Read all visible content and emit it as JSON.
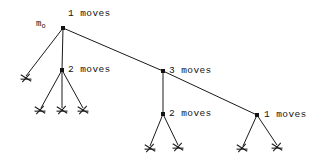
{
  "figure": {
    "background_color": "#ffffff",
    "line_color": "#1a1a1a",
    "text_color": "#111111"
  },
  "root": {
    "symbol_base": "m",
    "symbol_sub": "o",
    "label": "1 moves",
    "x": 63,
    "y": 28,
    "label_x": 68,
    "label_y": 8,
    "symbol_x": 36,
    "symbol_y": 19
  },
  "nodes": [
    {
      "id": "node-2-moves-left",
      "label": "2 moves",
      "x": 62,
      "y": 70,
      "label_x": 68,
      "label_y": 64,
      "children_count": 3
    },
    {
      "id": "node-3-moves",
      "label": "3 moves",
      "x": 163,
      "y": 71,
      "label_x": 169,
      "label_y": 65,
      "children_count": 1
    },
    {
      "id": "node-2-moves-lower",
      "label": "2 moves",
      "x": 163,
      "y": 114,
      "label_x": 169,
      "label_y": 108,
      "children_count": 2
    },
    {
      "id": "node-1-moves-right",
      "label": "1 moves",
      "x": 257,
      "y": 115,
      "label_x": 264,
      "label_y": 109,
      "children_count": 2
    }
  ],
  "leaves": [
    {
      "id": "leaf-root-1",
      "x": 26,
      "y": 78
    },
    {
      "id": "leaf-a-1",
      "x": 40,
      "y": 110
    },
    {
      "id": "leaf-a-2",
      "x": 62,
      "y": 110
    },
    {
      "id": "leaf-a-3",
      "x": 83,
      "y": 110
    },
    {
      "id": "leaf-b-1",
      "x": 150,
      "y": 148
    },
    {
      "id": "leaf-b-2",
      "x": 178,
      "y": 147
    },
    {
      "id": "leaf-c-1",
      "x": 242,
      "y": 148
    },
    {
      "id": "leaf-c-2",
      "x": 277,
      "y": 147
    }
  ],
  "edges": [
    {
      "id": "edge-root-to-leaf",
      "x1": 63,
      "y1": 28,
      "x2": 26,
      "y2": 76
    },
    {
      "id": "edge-root-to-node-2-left",
      "x1": 63,
      "y1": 28,
      "x2": 62,
      "y2": 70
    },
    {
      "id": "edge-root-to-node-3",
      "x1": 63,
      "y1": 28,
      "x2": 163,
      "y2": 71
    },
    {
      "id": "edge-node-3-to-node-1-right",
      "x1": 163,
      "y1": 71,
      "x2": 257,
      "y2": 115
    },
    {
      "id": "edge-2left-to-leaf-1",
      "x1": 62,
      "y1": 70,
      "x2": 41,
      "y2": 108
    },
    {
      "id": "edge-2left-to-leaf-2",
      "x1": 62,
      "y1": 70,
      "x2": 62,
      "y2": 108
    },
    {
      "id": "edge-2left-to-leaf-3",
      "x1": 62,
      "y1": 70,
      "x2": 83,
      "y2": 108
    },
    {
      "id": "edge-node-3-to-2lower",
      "x1": 163,
      "y1": 71,
      "x2": 163,
      "y2": 114
    },
    {
      "id": "edge-2lower-to-leaf-1",
      "x1": 163,
      "y1": 114,
      "x2": 150,
      "y2": 146
    },
    {
      "id": "edge-2lower-to-leaf-2",
      "x1": 163,
      "y1": 114,
      "x2": 178,
      "y2": 145
    },
    {
      "id": "edge-1right-to-leaf-1",
      "x1": 257,
      "y1": 115,
      "x2": 243,
      "y2": 146
    },
    {
      "id": "edge-1right-to-leaf-2",
      "x1": 257,
      "y1": 115,
      "x2": 277,
      "y2": 145
    }
  ]
}
